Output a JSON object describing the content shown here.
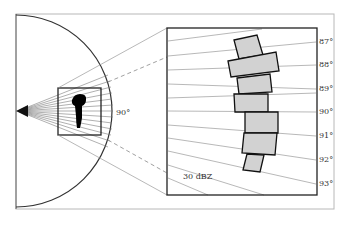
{
  "diagram": {
    "type": "radar-beam-zoom-diagram",
    "colors": {
      "frame": "#b0b0b0",
      "ink": "#222222",
      "beam_line": "#8a8a8a",
      "cell_fill": "#d4d4d4",
      "echo_black": "#000000"
    },
    "overview": {
      "angle_label": "90°"
    },
    "detail": {
      "reflectivity_label": "30  dBZ",
      "elevation_labels": [
        "87°",
        "88°",
        "89°",
        "90°",
        "91°",
        "92°",
        "93°"
      ]
    }
  }
}
